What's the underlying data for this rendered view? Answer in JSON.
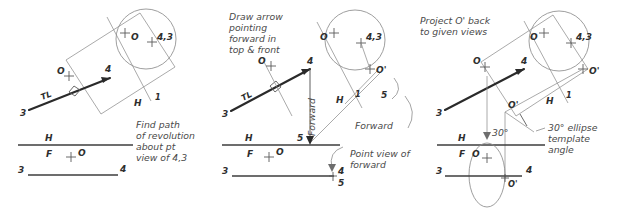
{
  "figure": {
    "background": "#ffffff",
    "ink_dark": "#2a2a2a",
    "ink_light": "#8d8d8d",
    "panels": [
      {
        "id": "panel-1",
        "note": [
          "Find path",
          "of revolution",
          "about pt",
          "view of 4,3"
        ],
        "labels": {
          "point_o_top": "O",
          "point_43": "4,3",
          "point_o_left": "O",
          "endpoint_3": "3",
          "endpoint_4": "4",
          "true_length": "TL",
          "fold_h": "H",
          "fold_1": "1",
          "front_h": "H",
          "front_f": "F",
          "front_o": "O",
          "bottom_3": "3",
          "bottom_4": "4"
        }
      },
      {
        "id": "panel-2",
        "note": [
          "Draw arrow",
          "pointing",
          "forward in",
          "top & front"
        ],
        "labels": {
          "point_o_top": "O",
          "point_43": "4,3",
          "point_o_prime": "O'",
          "point_o_left": "O",
          "endpoint_3": "3",
          "endpoint_4": "4",
          "endpoint_5": "5",
          "true_length": "TL",
          "fold_h": "H",
          "fold_1": "1",
          "aux_5": "5",
          "forward_vertical": "Forward",
          "forward_diagonal": "Forward",
          "front_h": "H",
          "front_f": "F",
          "front_o": "O",
          "front_5": "5",
          "bottom_3": "3",
          "bottom_4": "4",
          "bottom_5": "5",
          "point_view_note": [
            "Point view of",
            "forward"
          ]
        }
      },
      {
        "id": "panel-3",
        "note": [
          "Project O' back",
          "to given views"
        ],
        "labels": {
          "point_o_top": "O",
          "point_43": "4,3",
          "point_o_prime_circle": "O'",
          "point_o_left": "O",
          "point_o_prime_top": "O'",
          "endpoint_3": "3",
          "endpoint_4": "4",
          "fold_h": "H",
          "fold_1": "1",
          "angle_30": "30°",
          "front_h": "H",
          "front_f": "F",
          "front_o": "O",
          "bottom_3": "3",
          "bottom_4": "4",
          "front_o_prime": "O'",
          "template_note": [
            "30° ellipse",
            "template",
            "angle"
          ]
        }
      }
    ]
  }
}
